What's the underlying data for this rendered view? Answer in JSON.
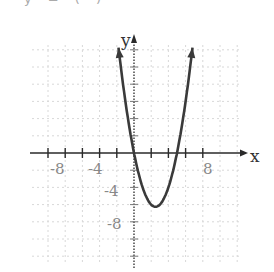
{
  "header": {
    "partial_text": "y = (     )"
  },
  "chart_data": {
    "type": "line",
    "title": "",
    "function": "y = x^2 - 5x",
    "xlabel": "x",
    "ylabel": "y",
    "x_tick_labels": [
      "-8",
      "-4",
      "8"
    ],
    "y_tick_labels": [
      "-4",
      "-8"
    ],
    "xlim": [
      -12,
      14
    ],
    "ylim": [
      -14,
      14
    ],
    "grid": true,
    "tick_step": 2,
    "zeros": [
      0,
      5
    ],
    "vertex": [
      2.5,
      -6.25
    ],
    "arrows": "both ends point upward",
    "x": [
      -1.8,
      -1,
      0,
      1,
      2,
      2.5,
      3,
      4,
      5,
      6,
      6.8
    ],
    "values": [
      12.24,
      6,
      0,
      -4,
      -6,
      -6.25,
      -6,
      -4,
      0,
      6,
      12.24
    ]
  },
  "colors": {
    "curve": "#3a3a3a",
    "axis": "#2a2a2a",
    "grid": "#d8d8d8",
    "background": "#ffffff"
  }
}
